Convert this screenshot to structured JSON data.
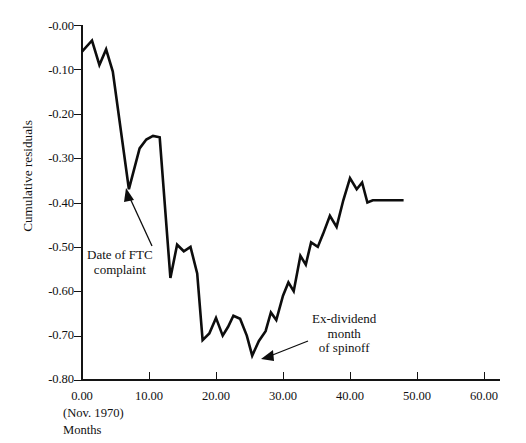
{
  "chart_data": {
    "type": "line",
    "title": "",
    "xlabel": "Months",
    "xlabel_sub": "(Nov. 1970)",
    "ylabel": "Cumulative residuals",
    "xlim": [
      0,
      60
    ],
    "ylim": [
      -0.8,
      0.0
    ],
    "grid": false,
    "legend": "none",
    "xticks": [
      "0.00",
      "10.00",
      "20.00",
      "30.00",
      "40.00",
      "50.00",
      "60.00"
    ],
    "xtick_values": [
      0,
      10,
      20,
      30,
      40,
      50,
      60
    ],
    "yticks": [
      "-0.00",
      "-0.10",
      "-0.20",
      "-0.30",
      "-0.40",
      "-0.50",
      "-0.60",
      "-0.70",
      "-0.80"
    ],
    "ytick_values": [
      0.0,
      -0.1,
      -0.2,
      -0.3,
      -0.4,
      -0.5,
      -0.6,
      -0.7,
      -0.8
    ],
    "series": [
      {
        "name": "Cumulative residuals",
        "color": "#0d0d0d",
        "x": [
          0,
          1.5,
          2.6,
          3.6,
          4.6,
          7.0,
          8.6,
          9.6,
          10.6,
          11.6,
          13.2,
          14.2,
          15.2,
          16.2,
          17.2,
          18.0,
          19.0,
          20.0,
          21.0,
          21.8,
          22.6,
          23.6,
          24.6,
          25.4,
          26.4,
          27.4,
          28.2,
          29.0,
          30.0,
          30.8,
          31.6,
          32.6,
          33.4,
          34.2,
          35.2,
          36.0,
          37.0,
          38.0,
          39.0,
          40.0,
          41.0,
          41.8,
          42.6,
          43.4,
          48.0
        ],
        "y": [
          -0.06,
          -0.035,
          -0.09,
          -0.055,
          -0.105,
          -0.37,
          -0.278,
          -0.258,
          -0.25,
          -0.253,
          -0.57,
          -0.495,
          -0.51,
          -0.5,
          -0.56,
          -0.71,
          -0.695,
          -0.66,
          -0.7,
          -0.68,
          -0.655,
          -0.662,
          -0.7,
          -0.745,
          -0.712,
          -0.69,
          -0.648,
          -0.665,
          -0.61,
          -0.58,
          -0.6,
          -0.52,
          -0.54,
          -0.49,
          -0.5,
          -0.47,
          -0.43,
          -0.455,
          -0.395,
          -0.345,
          -0.37,
          -0.355,
          -0.4,
          -0.395,
          -0.395
        ]
      }
    ],
    "annotations": [
      {
        "id": "ftc-complaint",
        "text_lines": [
          "Date of FTC",
          "complaint"
        ],
        "target_x": 7.0,
        "target_y": -0.37
      },
      {
        "id": "ex-dividend-spinoff",
        "text_lines": [
          "Ex-dividend",
          "month",
          "of spinoff"
        ],
        "target_x": 25.4,
        "target_y": -0.745
      }
    ]
  },
  "axis": {
    "y_title": "Cumulative residuals",
    "x_title": "Months",
    "x_origin_note": "(Nov. 1970)"
  },
  "colors": {
    "line": "#0d0d0d",
    "axis": "#141414",
    "background": "#ffffff"
  }
}
